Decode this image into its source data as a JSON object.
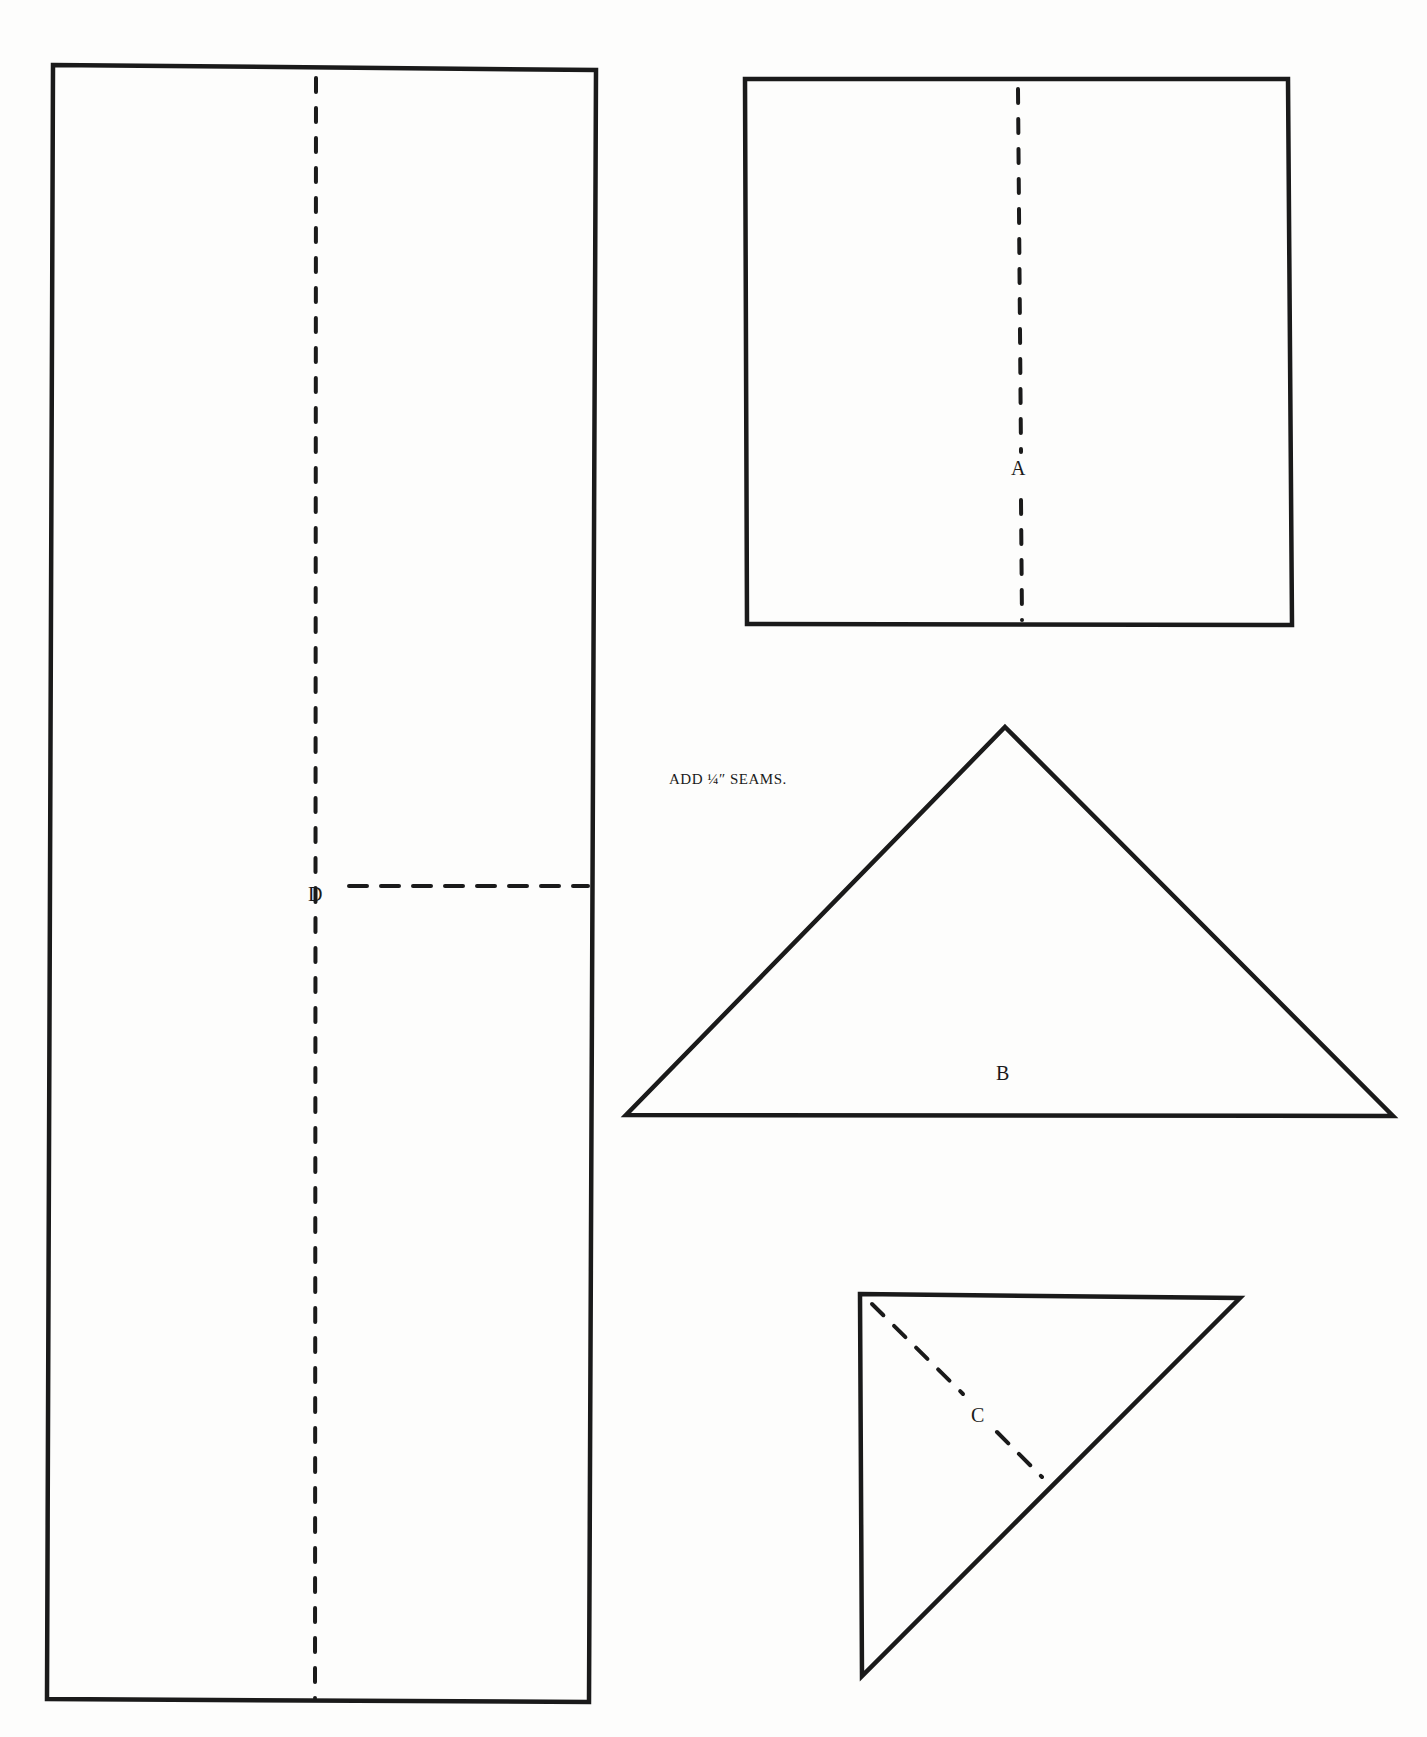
{
  "diagram": {
    "type": "quilt-pattern-template",
    "note": "ADD ¼″ SEAMS.",
    "pieces": [
      {
        "id": "D",
        "label": "D",
        "shape": "rectangle",
        "fold_lines": [
          "vertical-center",
          "horizontal-right-half"
        ]
      },
      {
        "id": "A",
        "label": "A",
        "shape": "square",
        "fold_lines": [
          "vertical-center"
        ]
      },
      {
        "id": "B",
        "label": "B",
        "shape": "isosceles-right-triangle",
        "fold_lines": []
      },
      {
        "id": "C",
        "label": "C",
        "shape": "right-triangle",
        "fold_lines": [
          "diagonal-from-right-angle"
        ]
      }
    ],
    "colors": {
      "line": "#1a1a1a",
      "paper": "#fdfdfc"
    }
  }
}
